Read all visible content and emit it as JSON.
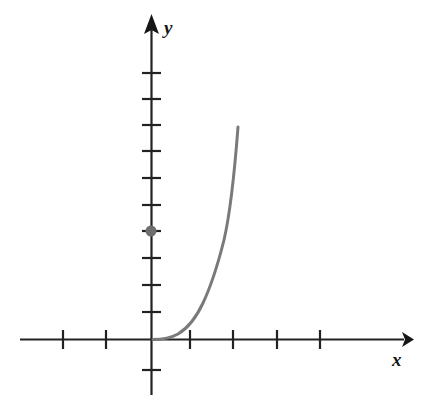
{
  "figure": {
    "width": 431,
    "height": 407,
    "background_color": "#ffffff"
  },
  "axes": {
    "x_label": "x",
    "y_label": "y",
    "axis_color": "#222222",
    "origin": {
      "x": 151,
      "y": 339
    },
    "x_axis": {
      "start_px": 20,
      "end_px": 412,
      "arrow": "right"
    },
    "y_axis": {
      "start_px": 15,
      "end_px": 395,
      "arrow": "up"
    },
    "x_tick_spacing_px": 43.5,
    "y_tick_spacing_px": 26,
    "x_tick_positions_px": [
      63,
      106,
      190,
      233,
      277,
      320
    ],
    "y_tick_positions_px": [
      73,
      98,
      123,
      150,
      176,
      205,
      231,
      257,
      283,
      312,
      370
    ],
    "tick_half_length_px": 9,
    "tick_labels_shown": false
  },
  "chart_data": {
    "type": "line",
    "title": "",
    "xlabel": "x",
    "ylabel": "y",
    "grid": false,
    "legend": null,
    "xlim": [
      -3,
      6
    ],
    "ylim": [
      -1,
      12
    ],
    "curve_color": "#7a7a7a",
    "curve_width_px": 3,
    "series": [
      {
        "name": "exponential-curve",
        "x": [
          0.1,
          0.3,
          0.5,
          0.7,
          0.9,
          1.1,
          1.3,
          1.5,
          1.65,
          1.8,
          1.95,
          2.0
        ],
        "y": [
          0.0,
          0.05,
          0.15,
          0.35,
          0.75,
          1.4,
          2.4,
          3.9,
          5.3,
          6.9,
          8.1,
          8.2
        ]
      }
    ],
    "points": [
      {
        "name": "y-intercept-dot",
        "x": 0,
        "y": 4,
        "px": 151,
        "py": 231,
        "color": "#6e6e6e",
        "radius_px": 5.5,
        "label": ""
      }
    ]
  }
}
